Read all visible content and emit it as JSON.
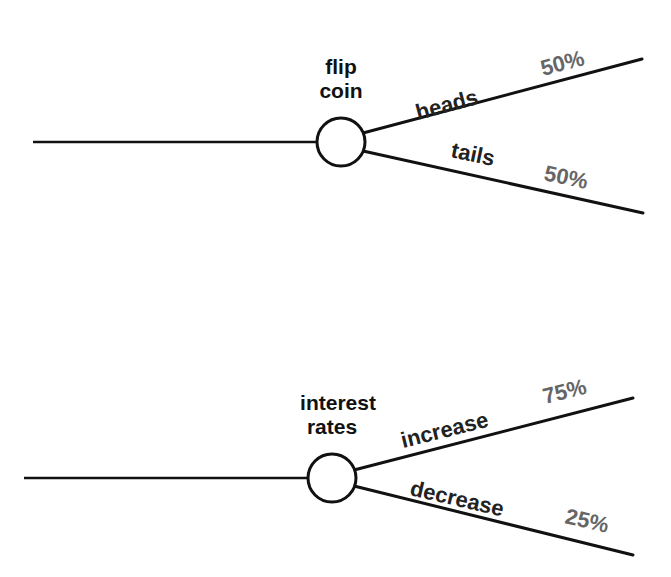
{
  "diagram": {
    "type": "chance-node-tree",
    "trees": [
      {
        "node_label_line1": "flip",
        "node_label_line2": "coin",
        "branches": [
          {
            "label": "heads",
            "probability": "50%"
          },
          {
            "label": "tails",
            "probability": "50%"
          }
        ]
      },
      {
        "node_label_line1": "interest",
        "node_label_line2": "rates",
        "branches": [
          {
            "label": "increase",
            "probability": "75%"
          },
          {
            "label": "decrease",
            "probability": "25%"
          }
        ]
      }
    ]
  },
  "colors": {
    "line": "#111111",
    "text": "#222222",
    "probability_text": "#666666",
    "background": "#ffffff"
  }
}
